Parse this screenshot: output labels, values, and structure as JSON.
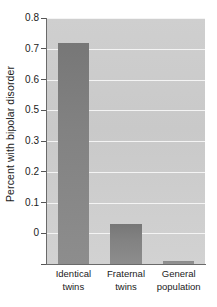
{
  "chart_data": {
    "type": "bar",
    "title": "",
    "subtitle": "",
    "xlabel": "",
    "ylabel": "Percent with bipolar disorder",
    "categories": [
      "Identical twins",
      "Fraternal twins",
      "General population"
    ],
    "category_lines": [
      [
        "Identical",
        "twins"
      ],
      [
        "Fraternal",
        "twins"
      ],
      [
        "General",
        "population"
      ]
    ],
    "values": [
      0.72,
      0.13,
      0.01
    ],
    "ylim": [
      0,
      0.8
    ],
    "ytick_labels": [
      "0.8",
      "0.7",
      "0.6",
      "0.5",
      "0.3",
      "0.2",
      "0.1",
      "0"
    ],
    "ytick_values": [
      0.8,
      0.7,
      0.6,
      0.5,
      0.4,
      0.3,
      0.2,
      0.1,
      0.0
    ],
    "grid": true,
    "grid_orientation": "horizontal",
    "legend": false,
    "legend_position": "none",
    "colors": {
      "plot_background": "#cccccc",
      "gridline": "#f4f4f4",
      "bar": "#828282",
      "bar_small": "#8f8f8f",
      "axis": "#6a6a6a",
      "text": "#1b1b1b",
      "page_background": "#ffffff"
    }
  }
}
